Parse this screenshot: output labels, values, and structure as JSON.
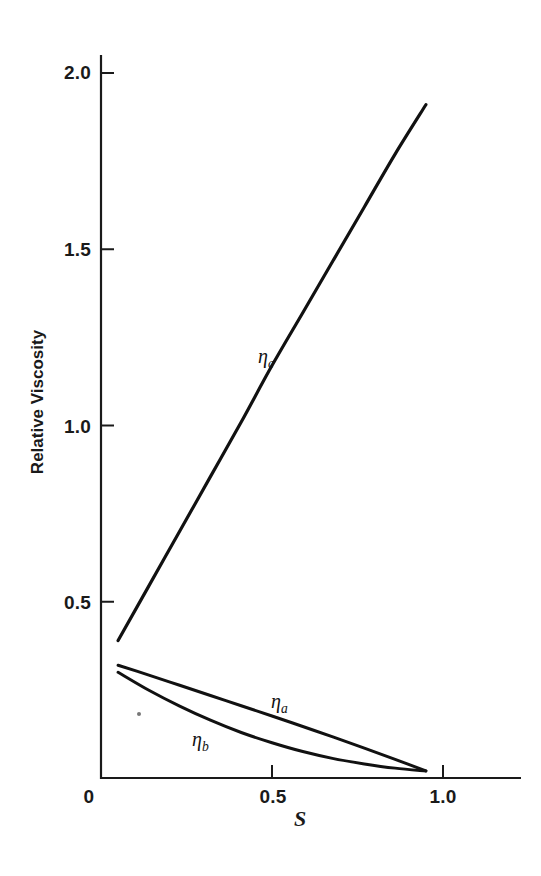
{
  "figure": {
    "background_color": "#ffffff",
    "ink_color": "#111111"
  },
  "axes": {
    "x_label": "S",
    "y_label": "Relative Viscosity",
    "x_ticks": [
      {
        "value": 0,
        "label": "0"
      },
      {
        "value": 0.5,
        "label": "0.5"
      },
      {
        "value": 1.0,
        "label": "1.0"
      }
    ],
    "y_ticks": [
      {
        "value": 0,
        "label": "0"
      },
      {
        "value": 0.5,
        "label": "0.5"
      },
      {
        "value": 1.0,
        "label": "1.0"
      },
      {
        "value": 1.5,
        "label": "1.5"
      },
      {
        "value": 2.0,
        "label": "2.0"
      }
    ]
  },
  "annotations": {
    "eta_c": {
      "symbol": "η",
      "subscript": "c"
    },
    "eta_a": {
      "symbol": "η",
      "subscript": "a"
    },
    "eta_b": {
      "symbol": "η",
      "subscript": "b"
    }
  },
  "chart_data": {
    "type": "line",
    "title": "",
    "subtitle": "",
    "xlabel": "S",
    "ylabel": "Relative Viscosity",
    "xlim": [
      0,
      1.22
    ],
    "ylim": [
      0,
      2.05
    ],
    "xticks": [
      0,
      0.5,
      1.0
    ],
    "xticklabels": [
      "0",
      "0.5",
      "1.0"
    ],
    "yticks": [
      0,
      0.5,
      1.0,
      1.5,
      2.0
    ],
    "yticklabels": [
      "0",
      "0.5",
      "1.0",
      "1.5",
      "2.0"
    ],
    "grid": false,
    "legend": "none",
    "tick_direction": "in",
    "annotations": [
      {
        "text": "ηc",
        "x": 0.5,
        "y": 1.19
      },
      {
        "text": "ηa",
        "x": 0.53,
        "y": 0.22
      },
      {
        "text": "ηb",
        "x": 0.3,
        "y": 0.11
      }
    ],
    "series": [
      {
        "name": "ηc",
        "color": "#111111",
        "linewidth": 3.2,
        "x": [
          0.05,
          0.14,
          0.23,
          0.32,
          0.41,
          0.5,
          0.59,
          0.68,
          0.77,
          0.86,
          0.95
        ],
        "y": [
          0.39,
          0.545,
          0.7,
          0.855,
          1.01,
          1.17,
          1.32,
          1.47,
          1.62,
          1.77,
          1.91
        ]
      },
      {
        "name": "ηa",
        "color": "#111111",
        "linewidth": 3.0,
        "x": [
          0.05,
          0.14,
          0.23,
          0.32,
          0.41,
          0.5,
          0.59,
          0.68,
          0.77,
          0.86,
          0.95
        ],
        "y": [
          0.32,
          0.292,
          0.263,
          0.234,
          0.205,
          0.176,
          0.146,
          0.116,
          0.085,
          0.053,
          0.02
        ]
      },
      {
        "name": "ηb",
        "color": "#111111",
        "linewidth": 3.0,
        "x": [
          0.05,
          0.14,
          0.23,
          0.32,
          0.41,
          0.5,
          0.59,
          0.68,
          0.77,
          0.86,
          0.95
        ],
        "y": [
          0.3,
          0.249,
          0.204,
          0.164,
          0.129,
          0.1,
          0.075,
          0.055,
          0.04,
          0.028,
          0.02
        ]
      }
    ]
  }
}
